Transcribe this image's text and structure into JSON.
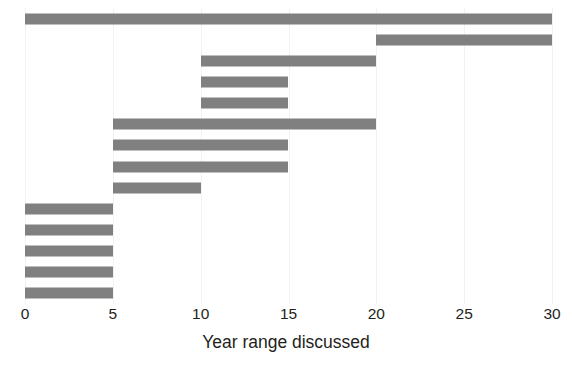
{
  "chart_data": {
    "type": "bar",
    "orientation": "horizontal",
    "subtype": "range-bar",
    "title": "",
    "xlabel": "Year range discussed",
    "ylabel": "",
    "xlim": [
      0,
      30
    ],
    "xticks": [
      0,
      5,
      10,
      15,
      20,
      25,
      30
    ],
    "xtick_labels": [
      "0",
      "5",
      "10",
      "15",
      "20",
      "25",
      "30"
    ],
    "yticks": [],
    "ytick_labels": [],
    "grid": "vertical-light",
    "legend": "none",
    "bar_color": "#808080",
    "grid_color": "#f2f2f2",
    "background_color": "#ffffff",
    "n_bars": 14,
    "bars": [
      {
        "index": 1,
        "start": 0,
        "end": 30,
        "span": 30
      },
      {
        "index": 2,
        "start": 20,
        "end": 30,
        "span": 10
      },
      {
        "index": 3,
        "start": 10,
        "end": 20,
        "span": 10
      },
      {
        "index": 4,
        "start": 10,
        "end": 15,
        "span": 5
      },
      {
        "index": 5,
        "start": 10,
        "end": 15,
        "span": 5
      },
      {
        "index": 6,
        "start": 5,
        "end": 20,
        "span": 15
      },
      {
        "index": 7,
        "start": 5,
        "end": 15,
        "span": 10
      },
      {
        "index": 8,
        "start": 5,
        "end": 15,
        "span": 10
      },
      {
        "index": 9,
        "start": 5,
        "end": 10,
        "span": 5
      },
      {
        "index": 10,
        "start": 0,
        "end": 5,
        "span": 5
      },
      {
        "index": 11,
        "start": 0,
        "end": 5,
        "span": 5
      },
      {
        "index": 12,
        "start": 0,
        "end": 5,
        "span": 5
      },
      {
        "index": 13,
        "start": 0,
        "end": 5,
        "span": 5
      },
      {
        "index": 14,
        "start": 0,
        "end": 5,
        "span": 5
      }
    ]
  }
}
